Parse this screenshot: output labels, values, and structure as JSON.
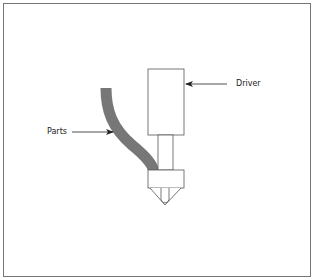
{
  "diagram": {
    "labels": {
      "driver": "Driver",
      "parts": "Parts"
    },
    "components": [
      {
        "name": "driver",
        "shape": "rectangle"
      },
      {
        "name": "shaft",
        "shape": "rectangle"
      },
      {
        "name": "collar",
        "shape": "rectangle"
      },
      {
        "name": "nozzle",
        "shape": "cone"
      },
      {
        "name": "parts-feed-tube",
        "shape": "curved-tube"
      }
    ],
    "colors": {
      "outline": "#555555",
      "tube": "#777777",
      "border": "#777777",
      "background": "#ffffff"
    }
  }
}
